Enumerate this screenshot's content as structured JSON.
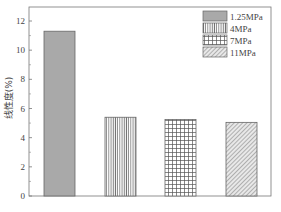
{
  "chart_data": {
    "type": "bar",
    "title": "",
    "xlabel": "",
    "ylabel": "线性度(%)",
    "categories": [
      "1.25MPa",
      "4MPa",
      "7MPa",
      "11MPa"
    ],
    "values": [
      11.3,
      5.4,
      5.25,
      5.05
    ],
    "ylim": [
      0,
      13
    ],
    "yticks": [
      0,
      2,
      4,
      6,
      8,
      10,
      12
    ],
    "grid": false,
    "legend": {
      "position": "upper right",
      "entries": [
        {
          "label": "1.25MPa",
          "pattern": "solid-gray"
        },
        {
          "label": "4MPa",
          "pattern": "vertical-lines"
        },
        {
          "label": "7MPa",
          "pattern": "grid"
        },
        {
          "label": "11MPa",
          "pattern": "diagonal-lines"
        }
      ]
    },
    "colors": {
      "bar_fill_solid": "#a9a9a9",
      "pattern_stroke": "#666666",
      "axis": "#555555"
    }
  },
  "caption": ""
}
